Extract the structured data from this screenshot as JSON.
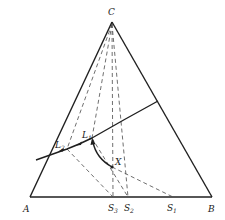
{
  "figure": {
    "type": "ternary-phase-diagram",
    "vertices": {
      "apex": {
        "label": "C"
      },
      "left": {
        "label": "A"
      },
      "right": {
        "label": "B"
      }
    },
    "points": {
      "x": {
        "label": "X"
      },
      "l1": {
        "label": "L",
        "sub": "1"
      },
      "l2": {
        "label": "L",
        "sub": "2"
      },
      "s1": {
        "label": "S",
        "sub": "1"
      },
      "s2": {
        "label": "S",
        "sub": "2"
      },
      "s3": {
        "label": "S",
        "sub": "3"
      }
    },
    "colors": {
      "line": "#1f1f1f",
      "dashed": "#4a4a4a",
      "background": "#ffffff"
    }
  }
}
